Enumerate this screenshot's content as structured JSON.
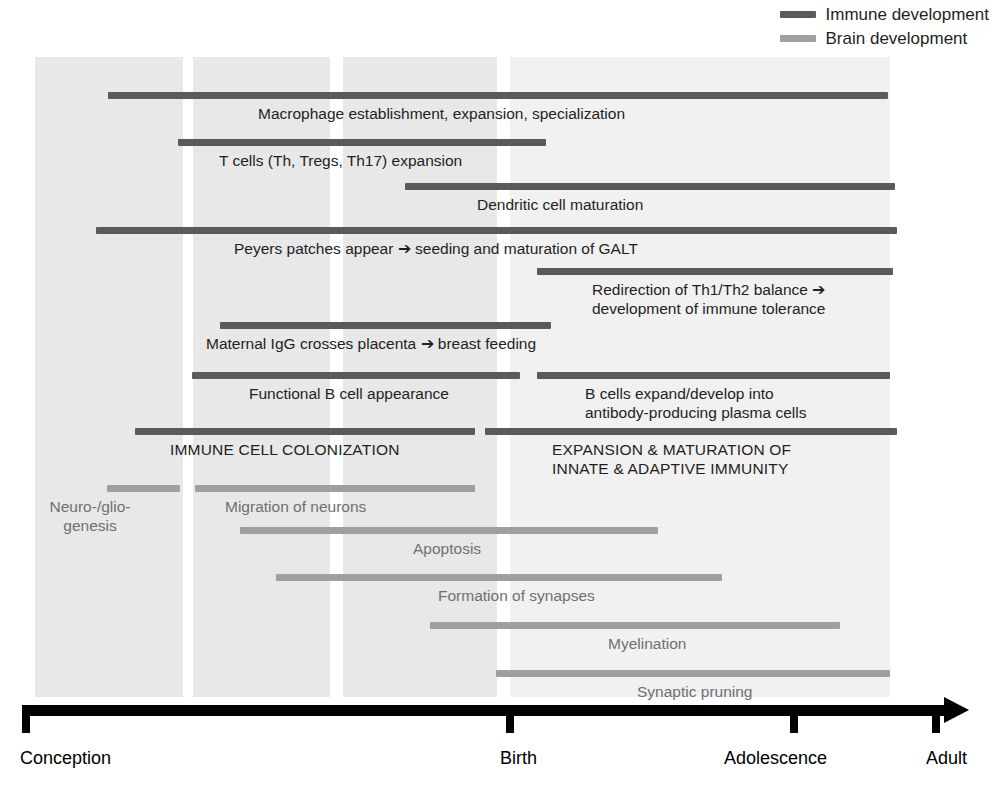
{
  "legend": {
    "items": [
      {
        "label": "Immune development",
        "color": "#595a5c",
        "key": "immune"
      },
      {
        "label": "Brain development",
        "color": "#9d9fa2",
        "key": "brain"
      }
    ]
  },
  "axis": {
    "ticks": [
      {
        "label": "Conception",
        "x": 22
      },
      {
        "label": "Birth",
        "x": 506
      },
      {
        "label": "Adolescence",
        "x": 790
      },
      {
        "label": "Adult",
        "x": 932
      }
    ]
  },
  "bands": [
    {
      "x": 35,
      "width": 148,
      "color": "#e8e8e9"
    },
    {
      "x": 193,
      "width": 137,
      "color": "#e8e8e9"
    },
    {
      "x": 343,
      "width": 154,
      "color": "#e8e8e9"
    },
    {
      "x": 510,
      "width": 380,
      "color": "#f1f1f2"
    }
  ],
  "chart_data": {
    "type": "bar",
    "xlabel": "",
    "ylabel": "",
    "x_axis_ticks": [
      "Conception",
      "Birth",
      "Adolescence",
      "Adult"
    ],
    "legend_position": "top-right",
    "grid": false,
    "series": [
      {
        "name": "Immune development",
        "color": "#595a5c"
      },
      {
        "name": "Brain development",
        "color": "#9d9fa2"
      }
    ],
    "bars": [
      {
        "label": "Macrophage establishment, expansion, specialization",
        "series": "Immune development",
        "start_px": 108,
        "end_px": 888,
        "bar_y": 92,
        "label_x": 258,
        "label_y": 104,
        "label_align": "left",
        "label_lines": 1
      },
      {
        "label": "T cells (Th, Tregs, Th17) expansion",
        "series": "Immune development",
        "start_px": 178,
        "end_px": 546,
        "bar_y": 139,
        "label_x": 219,
        "label_y": 151,
        "label_align": "left",
        "label_lines": 1
      },
      {
        "label": "Dendritic cell maturation",
        "series": "Immune development",
        "start_px": 405,
        "end_px": 895,
        "bar_y": 183,
        "label_x": 477,
        "label_y": 195,
        "label_align": "left",
        "label_lines": 1
      },
      {
        "label": "Peyers patches appear ➔ seeding and maturation of GALT",
        "series": "Immune development",
        "start_px": 96,
        "end_px": 897,
        "bar_y": 227,
        "label_x": 234,
        "label_y": 239,
        "label_align": "left",
        "label_lines": 1
      },
      {
        "label": "Redirection of Th1/Th2 balance ➔\ndevelopment of immune tolerance",
        "series": "Immune development",
        "start_px": 537,
        "end_px": 893,
        "bar_y": 268,
        "label_x": 592,
        "label_y": 280,
        "label_align": "left",
        "label_lines": 2
      },
      {
        "label": "Maternal IgG crosses placenta ➔ breast feeding",
        "series": "Immune development",
        "start_px": 220,
        "end_px": 551,
        "bar_y": 322,
        "label_x": 206,
        "label_y": 334,
        "label_align": "left",
        "label_lines": 1
      },
      {
        "label": "Functional B cell appearance",
        "series": "Immune development",
        "start_px": 192,
        "end_px": 520,
        "bar_y": 372,
        "label_x": 249,
        "label_y": 384,
        "label_align": "left",
        "label_lines": 1
      },
      {
        "label": "B cells expand/develop into\nantibody-producing plasma cells",
        "series": "Immune development",
        "start_px": 537,
        "end_px": 890,
        "bar_y": 372,
        "label_x": 585,
        "label_y": 384,
        "label_align": "left",
        "label_lines": 2
      },
      {
        "label": "IMMUNE CELL COLONIZATION",
        "series": "Immune development",
        "start_px": 135,
        "end_px": 475,
        "bar_y": 428,
        "label_x": 170,
        "label_y": 440,
        "label_align": "left",
        "label_lines": 1
      },
      {
        "label": "EXPANSION & MATURATION OF\nINNATE & ADAPTIVE IMMUNITY",
        "series": "Immune development",
        "start_px": 485,
        "end_px": 897,
        "bar_y": 428,
        "label_x": 552,
        "label_y": 440,
        "label_align": "left",
        "label_lines": 2
      },
      {
        "label": "Neuro-/glio-\ngenesis",
        "series": "Brain development",
        "start_px": 107,
        "end_px": 180,
        "bar_y": 485,
        "label_x": 90,
        "label_y": 497,
        "label_align": "center",
        "label_lines": 2
      },
      {
        "label": "Migration of neurons",
        "series": "Brain development",
        "start_px": 195,
        "end_px": 475,
        "bar_y": 485,
        "label_x": 225,
        "label_y": 497,
        "label_align": "left",
        "label_lines": 1
      },
      {
        "label": "Apoptosis",
        "series": "Brain development",
        "start_px": 240,
        "end_px": 658,
        "bar_y": 527,
        "label_x": 413,
        "label_y": 539,
        "label_align": "left",
        "label_lines": 1
      },
      {
        "label": "Formation of synapses",
        "series": "Brain development",
        "start_px": 276,
        "end_px": 722,
        "bar_y": 574,
        "label_x": 438,
        "label_y": 586,
        "label_align": "left",
        "label_lines": 1
      },
      {
        "label": "Myelination",
        "series": "Brain development",
        "start_px": 430,
        "end_px": 840,
        "bar_y": 622,
        "label_x": 608,
        "label_y": 634,
        "label_align": "left",
        "label_lines": 1
      },
      {
        "label": "Synaptic pruning",
        "series": "Brain development",
        "start_px": 496,
        "end_px": 890,
        "bar_y": 670,
        "label_x": 637,
        "label_y": 682,
        "label_align": "left",
        "label_lines": 1
      }
    ]
  }
}
